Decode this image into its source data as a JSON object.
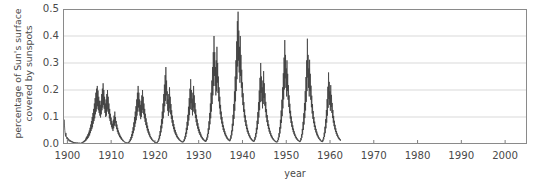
{
  "chart_data": {
    "type": "line",
    "title": "",
    "subtitle": "",
    "xlabel": "year",
    "ylabel": "percentage of Sun's surface covered by sunspots",
    "ylabel_line1": "percentage of Sun's surface",
    "ylabel_line2": "covered by sunspots",
    "xlim": [
      1899,
      2005
    ],
    "ylim": [
      0.0,
      0.5
    ],
    "grid": "horizontal",
    "legend": "none",
    "line_color": "#3c3c3c",
    "grid_color": "#cfcfcf",
    "axis_color": "#777777",
    "background": "#ffffff",
    "xticks": [
      1900,
      1910,
      1920,
      1930,
      1940,
      1950,
      1960,
      1970,
      1980,
      1990,
      2000
    ],
    "xtick_labels": [
      "1900",
      "1910",
      "1920",
      "1930",
      "1940",
      "1950",
      "1960",
      "1970",
      "1980",
      "1990",
      "2000"
    ],
    "yticks": [
      0.0,
      0.1,
      0.2,
      0.3,
      0.4,
      0.5
    ],
    "ytick_labels": [
      "0.0",
      "0.1",
      "0.2",
      "0.3",
      "0.4",
      "0.5"
    ],
    "series": [
      {
        "name": "sunspot area",
        "x_start": 1899.0,
        "x_step": 0.08333,
        "values": [
          0.03,
          0.052,
          0.071,
          0.09,
          0.07,
          0.05,
          0.038,
          0.028,
          0.041,
          0.03,
          0.022,
          0.018,
          0.025,
          0.018,
          0.014,
          0.02,
          0.012,
          0.01,
          0.016,
          0.011,
          0.008,
          0.014,
          0.01,
          0.007,
          0.011,
          0.006,
          0.009,
          0.005,
          0.008,
          0.004,
          0.007,
          0.004,
          0.006,
          0.003,
          0.006,
          0.004,
          0.005,
          0.003,
          0.006,
          0.003,
          0.005,
          0.002,
          0.004,
          0.003,
          0.005,
          0.003,
          0.004,
          0.002,
          0.004,
          0.002,
          0.005,
          0.003,
          0.006,
          0.004,
          0.008,
          0.005,
          0.01,
          0.006,
          0.012,
          0.008,
          0.015,
          0.01,
          0.02,
          0.012,
          0.026,
          0.016,
          0.03,
          0.019,
          0.036,
          0.022,
          0.042,
          0.028,
          0.05,
          0.032,
          0.06,
          0.04,
          0.072,
          0.048,
          0.085,
          0.055,
          0.1,
          0.062,
          0.115,
          0.075,
          0.13,
          0.085,
          0.15,
          0.095,
          0.17,
          0.11,
          0.19,
          0.12,
          0.205,
          0.13,
          0.215,
          0.14,
          0.198,
          0.125,
          0.175,
          0.115,
          0.16,
          0.105,
          0.145,
          0.098,
          0.16,
          0.11,
          0.185,
          0.125,
          0.205,
          0.135,
          0.225,
          0.145,
          0.2,
          0.13,
          0.175,
          0.115,
          0.15,
          0.1,
          0.165,
          0.105,
          0.185,
          0.12,
          0.2,
          0.128,
          0.175,
          0.112,
          0.15,
          0.095,
          0.13,
          0.085,
          0.112,
          0.072,
          0.098,
          0.062,
          0.085,
          0.055,
          0.075,
          0.048,
          0.09,
          0.058,
          0.105,
          0.068,
          0.12,
          0.078,
          0.1,
          0.065,
          0.085,
          0.055,
          0.072,
          0.045,
          0.06,
          0.038,
          0.05,
          0.032,
          0.042,
          0.026,
          0.035,
          0.022,
          0.03,
          0.018,
          0.025,
          0.015,
          0.02,
          0.012,
          0.016,
          0.01,
          0.013,
          0.008,
          0.01,
          0.006,
          0.008,
          0.005,
          0.007,
          0.004,
          0.006,
          0.004,
          0.005,
          0.003,
          0.006,
          0.004,
          0.008,
          0.005,
          0.012,
          0.007,
          0.018,
          0.011,
          0.026,
          0.016,
          0.036,
          0.022,
          0.048,
          0.03,
          0.062,
          0.04,
          0.08,
          0.05,
          0.1,
          0.063,
          0.12,
          0.076,
          0.14,
          0.088,
          0.165,
          0.105,
          0.19,
          0.12,
          0.215,
          0.135,
          0.19,
          0.12,
          0.165,
          0.105,
          0.145,
          0.092,
          0.16,
          0.1,
          0.18,
          0.115,
          0.2,
          0.126,
          0.175,
          0.11,
          0.15,
          0.095,
          0.13,
          0.082,
          0.112,
          0.07,
          0.095,
          0.06,
          0.08,
          0.05,
          0.068,
          0.042,
          0.056,
          0.035,
          0.046,
          0.028,
          0.038,
          0.024,
          0.03,
          0.019,
          0.025,
          0.015,
          0.02,
          0.012,
          0.016,
          0.01,
          0.013,
          0.008,
          0.01,
          0.006,
          0.008,
          0.005,
          0.007,
          0.004,
          0.006,
          0.004,
          0.008,
          0.005,
          0.012,
          0.008,
          0.02,
          0.013,
          0.032,
          0.02,
          0.048,
          0.03,
          0.068,
          0.043,
          0.092,
          0.058,
          0.12,
          0.075,
          0.15,
          0.095,
          0.185,
          0.117,
          0.22,
          0.14,
          0.255,
          0.16,
          0.285,
          0.18,
          0.235,
          0.148,
          0.195,
          0.123,
          0.165,
          0.104,
          0.185,
          0.117,
          0.21,
          0.132,
          0.175,
          0.11,
          0.148,
          0.093,
          0.125,
          0.079,
          0.105,
          0.066,
          0.088,
          0.055,
          0.074,
          0.046,
          0.062,
          0.039,
          0.052,
          0.033,
          0.043,
          0.027,
          0.036,
          0.023,
          0.03,
          0.019,
          0.025,
          0.016,
          0.021,
          0.013,
          0.017,
          0.011,
          0.014,
          0.009,
          0.012,
          0.007,
          0.01,
          0.006,
          0.009,
          0.006,
          0.012,
          0.008,
          0.018,
          0.011,
          0.028,
          0.018,
          0.042,
          0.026,
          0.06,
          0.038,
          0.082,
          0.052,
          0.108,
          0.068,
          0.138,
          0.087,
          0.17,
          0.107,
          0.205,
          0.129,
          0.24,
          0.151,
          0.2,
          0.126,
          0.168,
          0.106,
          0.19,
          0.12,
          0.215,
          0.135,
          0.18,
          0.113,
          0.152,
          0.096,
          0.128,
          0.081,
          0.108,
          0.068,
          0.091,
          0.057,
          0.077,
          0.048,
          0.064,
          0.04,
          0.054,
          0.034,
          0.045,
          0.028,
          0.038,
          0.024,
          0.031,
          0.02,
          0.026,
          0.016,
          0.022,
          0.014,
          0.018,
          0.011,
          0.015,
          0.009,
          0.013,
          0.008,
          0.016,
          0.01,
          0.024,
          0.015,
          0.038,
          0.024,
          0.058,
          0.037,
          0.084,
          0.053,
          0.115,
          0.073,
          0.15,
          0.095,
          0.19,
          0.12,
          0.235,
          0.148,
          0.285,
          0.18,
          0.34,
          0.215,
          0.4,
          0.252,
          0.34,
          0.215,
          0.285,
          0.18,
          0.31,
          0.195,
          0.36,
          0.227,
          0.3,
          0.189,
          0.25,
          0.158,
          0.21,
          0.132,
          0.175,
          0.11,
          0.145,
          0.091,
          0.12,
          0.076,
          0.1,
          0.063,
          0.083,
          0.052,
          0.069,
          0.044,
          0.057,
          0.036,
          0.047,
          0.03,
          0.039,
          0.025,
          0.032,
          0.02,
          0.027,
          0.017,
          0.022,
          0.014,
          0.018,
          0.012,
          0.015,
          0.01,
          0.02,
          0.013,
          0.032,
          0.02,
          0.05,
          0.032,
          0.075,
          0.047,
          0.108,
          0.068,
          0.148,
          0.093,
          0.195,
          0.123,
          0.25,
          0.158,
          0.31,
          0.196,
          0.38,
          0.24,
          0.455,
          0.287,
          0.49,
          0.309,
          0.42,
          0.265,
          0.36,
          0.227,
          0.4,
          0.252,
          0.33,
          0.208,
          0.275,
          0.173,
          0.228,
          0.144,
          0.188,
          0.119,
          0.155,
          0.098,
          0.128,
          0.081,
          0.106,
          0.067,
          0.088,
          0.055,
          0.072,
          0.045,
          0.06,
          0.038,
          0.049,
          0.031,
          0.04,
          0.025,
          0.033,
          0.021,
          0.027,
          0.017,
          0.022,
          0.014,
          0.018,
          0.011,
          0.015,
          0.009,
          0.012,
          0.008,
          0.016,
          0.01,
          0.026,
          0.016,
          0.04,
          0.025,
          0.06,
          0.038,
          0.086,
          0.054,
          0.118,
          0.074,
          0.155,
          0.098,
          0.198,
          0.125,
          0.245,
          0.155,
          0.3,
          0.189,
          0.25,
          0.158,
          0.21,
          0.132,
          0.235,
          0.148,
          0.27,
          0.17,
          0.225,
          0.142,
          0.188,
          0.118,
          0.156,
          0.098,
          0.129,
          0.081,
          0.107,
          0.067,
          0.088,
          0.056,
          0.073,
          0.046,
          0.06,
          0.038,
          0.049,
          0.031,
          0.04,
          0.025,
          0.033,
          0.021,
          0.027,
          0.017,
          0.022,
          0.014,
          0.018,
          0.011,
          0.014,
          0.009,
          0.012,
          0.007,
          0.01,
          0.006,
          0.009,
          0.006,
          0.014,
          0.009,
          0.024,
          0.015,
          0.04,
          0.025,
          0.062,
          0.039,
          0.09,
          0.057,
          0.124,
          0.078,
          0.164,
          0.103,
          0.21,
          0.132,
          0.262,
          0.165,
          0.32,
          0.202,
          0.385,
          0.243,
          0.33,
          0.208,
          0.28,
          0.176,
          0.31,
          0.196,
          0.26,
          0.164,
          0.218,
          0.137,
          0.18,
          0.114,
          0.149,
          0.094,
          0.123,
          0.078,
          0.102,
          0.064,
          0.084,
          0.053,
          0.069,
          0.044,
          0.057,
          0.036,
          0.047,
          0.03,
          0.038,
          0.024,
          0.031,
          0.02,
          0.026,
          0.016,
          0.021,
          0.013,
          0.017,
          0.011,
          0.014,
          0.009,
          0.011,
          0.007,
          0.014,
          0.009,
          0.022,
          0.014,
          0.036,
          0.023,
          0.056,
          0.035,
          0.082,
          0.052,
          0.114,
          0.072,
          0.152,
          0.096,
          0.196,
          0.124,
          0.248,
          0.156,
          0.31,
          0.196,
          0.39,
          0.246,
          0.33,
          0.208,
          0.28,
          0.176,
          0.312,
          0.197,
          0.26,
          0.164,
          0.216,
          0.136,
          0.179,
          0.113,
          0.148,
          0.093,
          0.122,
          0.077,
          0.1,
          0.063,
          0.083,
          0.052,
          0.068,
          0.043,
          0.056,
          0.035,
          0.046,
          0.029,
          0.038,
          0.024,
          0.031,
          0.019,
          0.025,
          0.016,
          0.02,
          0.013,
          0.017,
          0.01,
          0.013,
          0.008,
          0.011,
          0.007,
          0.016,
          0.01,
          0.026,
          0.017,
          0.042,
          0.026,
          0.064,
          0.04,
          0.092,
          0.058,
          0.126,
          0.079,
          0.166,
          0.105,
          0.212,
          0.134,
          0.265,
          0.167,
          0.23,
          0.145,
          0.195,
          0.123,
          0.218,
          0.137,
          0.182,
          0.115,
          0.152,
          0.096,
          0.126,
          0.079,
          0.104,
          0.066,
          0.086,
          0.054,
          0.071,
          0.045,
          0.058,
          0.037,
          0.048,
          0.03,
          0.039,
          0.025,
          0.032,
          0.02,
          0.026,
          0.017,
          0.022,
          0.014,
          0.018,
          0.011
        ]
      }
    ],
    "annotations": [
      {
        "text": "maximum value",
        "value": 0.49,
        "year": 1958
      },
      {
        "text": "minimum cycle",
        "value": 0.002,
        "year": 1901
      }
    ]
  }
}
